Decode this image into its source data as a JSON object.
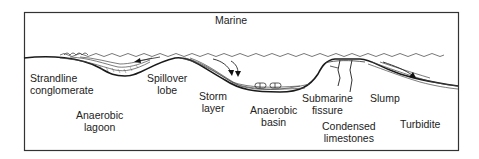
{
  "diagram": {
    "type": "geological cross-section",
    "frame_color": "#333333",
    "line_color": "#222222",
    "labels": {
      "marine": "Marine",
      "strandline": [
        "Strandline",
        "conglomerate"
      ],
      "spillover": [
        "Spillover",
        "lobe"
      ],
      "anaerobic_lagoon": [
        "Anaerobic",
        "lagoon"
      ],
      "storm": [
        "Storm",
        "layer"
      ],
      "anaerobic_basin": [
        "Anaerobic",
        "basin"
      ],
      "submarine_fissure": [
        "Submarine",
        "fissure"
      ],
      "slump": "Slump",
      "condensed": [
        "Condensed",
        "limestones"
      ],
      "turbidite": "Turbidite"
    }
  }
}
